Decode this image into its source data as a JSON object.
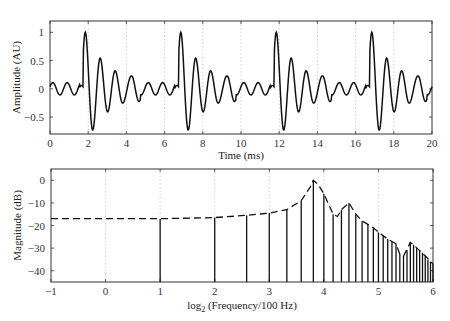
{
  "chart_data": [
    {
      "type": "line",
      "title": "",
      "xlabel": "Time (ms)",
      "ylabel": "Amplitude (AU)",
      "xlim": [
        0,
        20
      ],
      "ylim": [
        -0.8,
        1.2
      ],
      "xticks": [
        0,
        2,
        4,
        6,
        8,
        10,
        12,
        14,
        16,
        18,
        20
      ],
      "yticks": [
        -0.5,
        0,
        0.5,
        1
      ],
      "ytick_labels": [
        "−0.5",
        "0",
        "0.5",
        "1"
      ],
      "grid": "vertical dotted at even x ticks",
      "series": [
        {
          "name": "waveform",
          "description": "periodic decaying oscillation, period 5 ms, pulses at ~1.8, 6.8, 11.8, 16.8 ms",
          "period_ms": 5,
          "pulse_onsets_ms": [
            1.75,
            6.75,
            11.75,
            16.75
          ],
          "peak_values": [
            1.0,
            -0.5,
            0.57,
            -0.6,
            0.42,
            -0.27,
            0.33,
            -0.27,
            0.17,
            -0.13,
            0.17,
            -0.1,
            0.1,
            -0.07
          ],
          "x": [
            0.0,
            0.15,
            0.4,
            0.75,
            1.15,
            1.5,
            1.75,
            1.85,
            2.2,
            2.6,
            2.95,
            3.3,
            3.65,
            4.0,
            4.35,
            4.75,
            5.1,
            5.45,
            5.8,
            6.2,
            6.55,
            6.75,
            6.85,
            7.2,
            7.6,
            7.95
          ],
          "y": [
            -0.15,
            -0.15,
            0.17,
            -0.1,
            0.1,
            -0.05,
            -0.05,
            1.0,
            -0.5,
            0.57,
            -0.6,
            0.42,
            -0.27,
            0.33,
            -0.27,
            0.17,
            -0.13,
            0.17,
            -0.1,
            0.1,
            -0.07,
            -0.05,
            1.0,
            -0.5,
            0.57,
            -0.6
          ]
        }
      ]
    },
    {
      "type": "stem",
      "title": "",
      "xlabel": "log2(Frequency/100 Hz)",
      "xlabel_parts": {
        "pre": "log",
        "sub": "2",
        "post": " (Frequency/100 Hz)"
      },
      "ylabel": "Magnitude (dB)",
      "xlim": [
        -1,
        6
      ],
      "ylim": [
        -45,
        5
      ],
      "xticks": [
        -1,
        0,
        1,
        2,
        3,
        4,
        5,
        6
      ],
      "xtick_labels": [
        "−1",
        "0",
        "1",
        "2",
        "3",
        "4",
        "5",
        "6"
      ],
      "yticks": [
        0,
        -10,
        -20,
        -30,
        -40
      ],
      "ytick_labels": [
        "0",
        "−10",
        "−20",
        "−30",
        "−40"
      ],
      "grid": "vertical dotted at integer x ticks",
      "series": [
        {
          "name": "harmonics",
          "style": "solid stems",
          "harmonic_numbers": [
            2,
            4,
            6,
            8,
            10,
            12,
            14,
            16,
            18,
            20,
            22,
            24,
            26,
            28,
            30,
            32,
            34,
            36,
            38,
            40,
            42,
            44,
            46,
            48,
            50,
            52,
            54,
            56,
            58,
            60,
            62,
            64
          ],
          "values_db": [
            -17,
            -16.5,
            -15.5,
            -14.5,
            -13,
            -9,
            0,
            -6,
            -15,
            -13,
            -10,
            -15,
            -18,
            -19.5,
            -21,
            -23,
            -24.5,
            -26,
            -27,
            -28,
            -32.5,
            -33.5,
            -31,
            -27.5,
            -28.5,
            -30,
            -31,
            -32,
            -33.5,
            -35,
            -36,
            -37
          ]
        },
        {
          "name": "spectral envelope",
          "style": "dashed",
          "x": [
            -1,
            0,
            1,
            2,
            2.585,
            3,
            3.32,
            3.585,
            3.75,
            3.807,
            3.9,
            4.0,
            4.17,
            4.25,
            4.32,
            4.46,
            4.585,
            4.7,
            4.807,
            4.907,
            5.0,
            5.17,
            5.32,
            5.39,
            5.46,
            5.585,
            5.64,
            5.75,
            5.86,
            6.0
          ],
          "y": [
            -17,
            -17,
            -17,
            -16.5,
            -15.5,
            -14.5,
            -13,
            -9,
            -3,
            0,
            -2,
            -6,
            -15,
            -16,
            -13,
            -10,
            -15,
            -18,
            -19.5,
            -21,
            -23,
            -26,
            -28,
            -32.5,
            -33.5,
            -27.5,
            -28.5,
            -31,
            -33.5,
            -37
          ]
        }
      ]
    }
  ]
}
